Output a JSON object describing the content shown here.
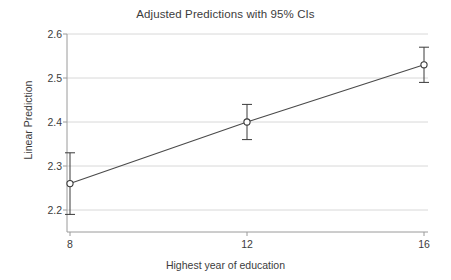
{
  "chart_data": {
    "type": "line",
    "title": "Adjusted Predictions with 95% CIs",
    "xlabel": "Highest year of education",
    "ylabel": "Linear Prediction",
    "x": [
      8,
      12,
      16
    ],
    "values": [
      2.26,
      2.4,
      2.53
    ],
    "ci_lower": [
      2.19,
      2.36,
      2.49
    ],
    "ci_upper": [
      2.33,
      2.44,
      2.57
    ],
    "xtick_labels": [
      "8",
      "12",
      "16"
    ],
    "ytick_labels": [
      "2.2",
      "2.3",
      "2.4",
      "2.5",
      "2.6"
    ],
    "ytick_values": [
      2.2,
      2.3,
      2.4,
      2.5,
      2.6
    ],
    "xlim": [
      8,
      16
    ],
    "ylim": [
      2.15,
      2.6
    ],
    "grid": "horizontal",
    "legend": "none",
    "series_name": "Linear Prediction",
    "marker": "open-circle",
    "errorbar_style": "capped",
    "colors": {
      "line": "#4a4a4a",
      "marker": "#3a3a3a",
      "errorbar": "#3a3a3a",
      "gridline": "#d8d8d8",
      "axis": "#9a9a9a",
      "text": "#3c3c3c",
      "background": "#ffffff"
    }
  }
}
